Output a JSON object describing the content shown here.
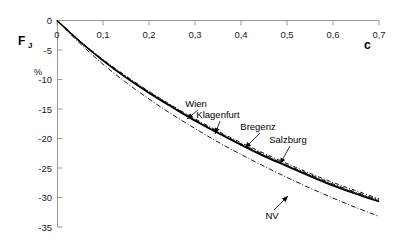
{
  "chart_data": {
    "type": "line",
    "title": "",
    "xlabel": "c",
    "ylabel": "F_J",
    "ylabel_main": "F",
    "ylabel_sub": "J",
    "yunit": "%",
    "xlim": [
      0,
      0.7
    ],
    "ylim": [
      -35,
      0
    ],
    "grid": false,
    "legend_position": "inline-annotations",
    "x_ticks": [
      "0",
      "0,1",
      "0,2",
      "0,3",
      "0,4",
      "0,5",
      "0,6",
      "0,7"
    ],
    "x_tick_values": [
      0,
      0.1,
      0.2,
      0.3,
      0.4,
      0.5,
      0.6,
      0.7
    ],
    "y_ticks": [
      "0",
      "-5",
      "-10",
      "-15",
      "-20",
      "-25",
      "-30",
      "-35"
    ],
    "y_tick_values": [
      0,
      -5,
      -10,
      -15,
      -20,
      -25,
      -30,
      -35
    ],
    "x": [
      0,
      0.05,
      0.1,
      0.15,
      0.2,
      0.25,
      0.3,
      0.35,
      0.4,
      0.45,
      0.5,
      0.55,
      0.6,
      0.65,
      0.7
    ],
    "series": [
      {
        "name": "Wien",
        "style": "solid",
        "values": [
          0,
          -3.6,
          -6.8,
          -9.7,
          -12.3,
          -14.7,
          -17.0,
          -19.1,
          -21.1,
          -23.0,
          -24.7,
          -26.4,
          -28.0,
          -29.4,
          -30.7
        ]
      },
      {
        "name": "Klagenfurt",
        "style": "dash-dot",
        "values": [
          0,
          -3.5,
          -6.7,
          -9.5,
          -12.1,
          -14.5,
          -16.8,
          -18.9,
          -20.9,
          -22.7,
          -24.5,
          -26.1,
          -27.7,
          -29.1,
          -30.4
        ]
      },
      {
        "name": "Bregenz",
        "style": "thin",
        "values": [
          0,
          -3.55,
          -6.75,
          -9.6,
          -12.2,
          -14.6,
          -16.9,
          -19.0,
          -21.0,
          -22.85,
          -24.6,
          -26.25,
          -27.85,
          -29.25,
          -30.55
        ]
      },
      {
        "name": "Salzburg",
        "style": "dotted",
        "values": [
          0,
          -3.45,
          -6.6,
          -9.4,
          -12.0,
          -14.4,
          -16.65,
          -18.75,
          -20.7,
          -22.5,
          -24.25,
          -25.9,
          -27.45,
          -28.85,
          -30.2
        ]
      },
      {
        "name": "NV",
        "style": "dash-dot-long",
        "values": [
          0,
          -3.9,
          -7.4,
          -10.5,
          -13.3,
          -15.9,
          -18.3,
          -20.6,
          -22.7,
          -24.7,
          -26.6,
          -28.4,
          -30.1,
          -31.7,
          -33.2
        ]
      }
    ],
    "annotations": [
      {
        "name": "Wien",
        "label_x": 196,
        "label_y": 107,
        "tip_x": 187,
        "tip_y": 119
      },
      {
        "name": "Klagenfurt",
        "label_x": 218,
        "label_y": 118,
        "tip_x": 215,
        "tip_y": 134
      },
      {
        "name": "Bregenz",
        "label_x": 258,
        "label_y": 130,
        "tip_x": 245,
        "tip_y": 148
      },
      {
        "name": "Salzburg",
        "label_x": 288,
        "label_y": 143,
        "tip_x": 280,
        "tip_y": 164
      },
      {
        "name": "NV",
        "label_x": 272,
        "label_y": 219,
        "tip_x": 288,
        "tip_y": 196
      }
    ]
  },
  "colors": {
    "background": "#ffffff",
    "ink": "#000000",
    "axis": "#9a9a9a",
    "tick_text": "#1a1a1a"
  }
}
